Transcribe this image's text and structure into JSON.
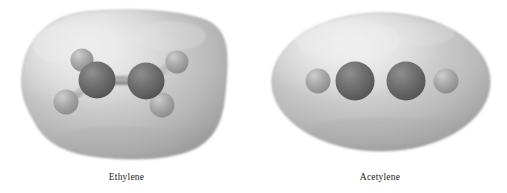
{
  "figure": {
    "background_color": "#ffffff",
    "molecules": [
      {
        "id": "ethylene",
        "caption": "Ethylene",
        "formula": "C2H4",
        "geometry": "planar",
        "surface": {
          "shape": "rounded-blob",
          "center_x": 122,
          "center_y": 84,
          "width": 205,
          "height": 148,
          "fill_light": "#dcdcdc",
          "fill_mid": "#bdbdbd",
          "fill_dark": "#9e9e9e",
          "edge_color": "#8d8d8d"
        },
        "atoms": [
          {
            "label": "C",
            "element": "carbon",
            "x": 97,
            "y": 80,
            "r": 18,
            "color": "#6f6f6f",
            "highlight": "#8e8e8e"
          },
          {
            "label": "C",
            "element": "carbon",
            "x": 146,
            "y": 81,
            "r": 18,
            "color": "#6f6f6f",
            "highlight": "#8e8e8e"
          },
          {
            "label": "H",
            "element": "hydrogen",
            "x": 82,
            "y": 60,
            "r": 11,
            "color": "#a9a9a9",
            "highlight": "#c9c9c9"
          },
          {
            "label": "H",
            "element": "hydrogen",
            "x": 66,
            "y": 102,
            "r": 12,
            "color": "#a2a2a2",
            "highlight": "#c4c4c4"
          },
          {
            "label": "H",
            "element": "hydrogen",
            "x": 177,
            "y": 62,
            "r": 11,
            "color": "#a9a9a9",
            "highlight": "#c9c9c9"
          },
          {
            "label": "H",
            "element": "hydrogen",
            "x": 162,
            "y": 105,
            "r": 12,
            "color": "#9c9c9c",
            "highlight": "#bebebe"
          }
        ],
        "bonds": [
          {
            "from": 0,
            "to": 1,
            "type": "double"
          },
          {
            "from": 0,
            "to": 2,
            "type": "single"
          },
          {
            "from": 0,
            "to": 3,
            "type": "single"
          },
          {
            "from": 1,
            "to": 4,
            "type": "single"
          },
          {
            "from": 1,
            "to": 5,
            "type": "single"
          }
        ]
      },
      {
        "id": "acetylene",
        "caption": "Acetylene",
        "formula": "C2H2",
        "geometry": "linear",
        "surface": {
          "shape": "ellipse",
          "center_x": 381,
          "center_y": 82,
          "width": 218,
          "height": 137,
          "fill_light": "#dedede",
          "fill_mid": "#bfbfbf",
          "fill_dark": "#a0a0a0",
          "edge_color": "#8f8f8f"
        },
        "atoms": [
          {
            "label": "H",
            "element": "hydrogen",
            "x": 318,
            "y": 81,
            "r": 12,
            "color": "#a5a5a5",
            "highlight": "#c6c6c6"
          },
          {
            "label": "C",
            "element": "carbon",
            "x": 355,
            "y": 81,
            "r": 19,
            "color": "#6b6b6b",
            "highlight": "#8b8b8b"
          },
          {
            "label": "C",
            "element": "carbon",
            "x": 406,
            "y": 81,
            "r": 19,
            "color": "#6b6b6b",
            "highlight": "#8b8b8b"
          },
          {
            "label": "H",
            "element": "hydrogen",
            "x": 446,
            "y": 81,
            "r": 12,
            "color": "#b0b0b0",
            "highlight": "#cfcfcf"
          }
        ],
        "bonds": [
          {
            "from": 0,
            "to": 1,
            "type": "single"
          },
          {
            "from": 1,
            "to": 2,
            "type": "triple"
          },
          {
            "from": 2,
            "to": 3,
            "type": "single"
          }
        ]
      }
    ]
  }
}
